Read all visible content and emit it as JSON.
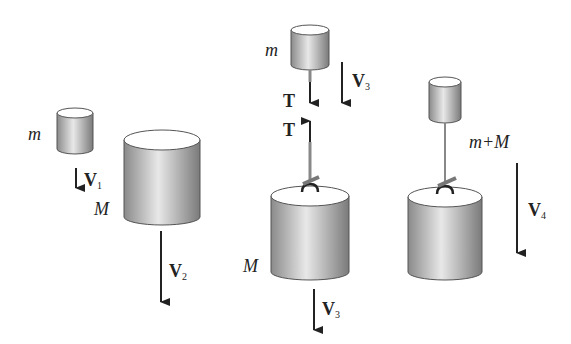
{
  "diagram": {
    "scenes": [
      {
        "id": "separate",
        "objects": [
          {
            "label": "m",
            "type": "small-cylinder"
          },
          {
            "label": "M",
            "type": "large-cylinder"
          }
        ],
        "vectors": [
          {
            "label": "V",
            "sub": "1"
          },
          {
            "label": "V",
            "sub": "2"
          }
        ]
      },
      {
        "id": "string-taut",
        "objects": [
          {
            "label": "m",
            "type": "small-cylinder"
          },
          {
            "label": "M",
            "type": "large-cylinder"
          }
        ],
        "vectors": [
          {
            "label": "V",
            "sub": "3"
          },
          {
            "label": "T",
            "sub": ""
          },
          {
            "label": "T",
            "sub": ""
          },
          {
            "label": "V",
            "sub": "3"
          }
        ]
      },
      {
        "id": "combined",
        "objects": [
          {
            "label": "m+M",
            "type": "joined-system"
          }
        ],
        "vectors": [
          {
            "label": "V",
            "sub": "4"
          }
        ]
      }
    ]
  }
}
